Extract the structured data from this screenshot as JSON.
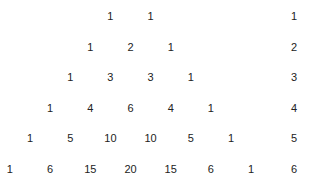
{
  "rows": [
    {
      "label": "1",
      "values": [
        "1",
        "1"
      ]
    },
    {
      "label": "2",
      "values": [
        "1",
        "2",
        "1"
      ]
    },
    {
      "label": "3",
      "values": [
        "1",
        "3",
        "3",
        "1"
      ]
    },
    {
      "label": "4",
      "values": [
        "1",
        "4",
        "6",
        "4",
        "1"
      ]
    },
    {
      "label": "5",
      "values": [
        "1",
        "5",
        "10",
        "10",
        "5",
        "1"
      ]
    },
    {
      "label": "6",
      "values": [
        "1",
        "6",
        "15",
        "20",
        "15",
        "6",
        "1"
      ]
    }
  ]
}
